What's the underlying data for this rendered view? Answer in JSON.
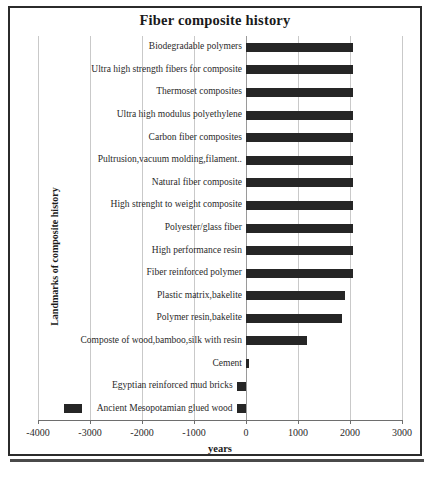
{
  "chart_data": {
    "type": "bar",
    "orientation": "horizontal",
    "title": "Fiber composite history",
    "xlabel": "years",
    "ylabel": "Landmarks of composite history",
    "xlim": [
      -4000,
      3000
    ],
    "xticks": [
      -4000,
      -3000,
      -2000,
      -1000,
      0,
      1000,
      2000,
      3000
    ],
    "xtick_labels": [
      "-4000",
      "-3000",
      "-2000",
      "-1000",
      "0",
      "1000",
      "2000",
      "3000"
    ],
    "grid": true,
    "legend": "none",
    "categories": [
      "Biodegradable polymers",
      "Ultra high strength fibers for  composite",
      "Thermoset composites",
      "Ultra high modulus  polyethylene",
      "Carbon fiber composites",
      "Pultrusion,vacuum molding,filament..",
      "Natural fiber composite",
      "High strenght to weight composite",
      "Polyester/glass fiber",
      "High performance resin",
      "Fiber reinforced polymer",
      "Plastic matrix,bakelite",
      "Polymer resin,bakelite",
      "Composte of wood,bamboo,silk with resin",
      "Cement",
      "Egyptian reinforced mud bricks",
      "Ancient Mesopotamian  glued wood"
    ],
    "values": [
      2050,
      2050,
      2050,
      2050,
      2050,
      2050,
      2050,
      2050,
      2050,
      2050,
      2050,
      1900,
      1840,
      1180,
      60,
      -180,
      -180
    ],
    "extra_segments": [
      {
        "category": "Ancient Mesopotamian  glued wood",
        "start": -3500,
        "end": -3150
      }
    ]
  },
  "figure": {
    "background": "#ffffff",
    "bar_color": "#262626",
    "grid_color": "#c9c9c9",
    "axis_color": "#6e6e6e",
    "frame_color": "#2b2b2b"
  }
}
